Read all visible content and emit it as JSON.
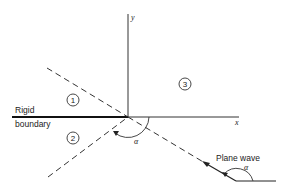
{
  "axes": {
    "x_label": "x",
    "y_label": "y"
  },
  "boundary": {
    "line1": "Rigid",
    "line2": "boundary"
  },
  "regions": [
    "1",
    "2",
    "3"
  ],
  "wave": {
    "label": "Plane wave",
    "angle_symbol": "α"
  },
  "origin_angle_symbol": "α",
  "colors": {
    "ink": "#222222",
    "background": "#ffffff"
  }
}
